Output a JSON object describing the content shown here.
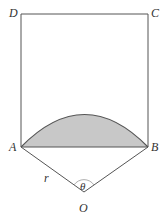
{
  "diagram": {
    "points": {
      "D": {
        "label": "D",
        "x": 21,
        "y": 14
      },
      "C": {
        "label": "C",
        "x": 148,
        "y": 14
      },
      "A": {
        "label": "A",
        "x": 21,
        "y": 147
      },
      "B": {
        "label": "B",
        "x": 148,
        "y": 147
      },
      "O": {
        "label": "O",
        "x": 84,
        "y": 192
      }
    },
    "labels": {
      "radius": "r",
      "angle": "θ"
    },
    "colors": {
      "line": "#555555",
      "segment_fill": "#c8c8c8",
      "angle_arc": "#999999"
    },
    "shapes": [
      "square ABCD",
      "circular segment on AB",
      "sector radii OA and OB"
    ]
  }
}
